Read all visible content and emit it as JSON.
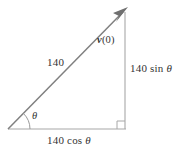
{
  "figure": {
    "background_color": "#ffffff",
    "colors": {
      "hypotenuse": "#808080",
      "leg": "#a8a8a8",
      "arc": "#999999",
      "arrowhead": "#707070",
      "text": "#333333"
    },
    "labels": {
      "magnitude": "140",
      "vector_bold": "v",
      "vector_arg": "(0)",
      "opposite_value": "140 sin ",
      "opposite_symbol": "θ",
      "adjacent_value": "140 cos ",
      "adjacent_symbol": "θ",
      "angle_symbol": "θ"
    },
    "geometry": {
      "origin_x": 8,
      "origin_y": 129,
      "tip_x": 127,
      "tip_y": 8,
      "corner_x": 125,
      "corner_y": 129,
      "arc_radius": 22,
      "right_angle_size": 8
    }
  }
}
